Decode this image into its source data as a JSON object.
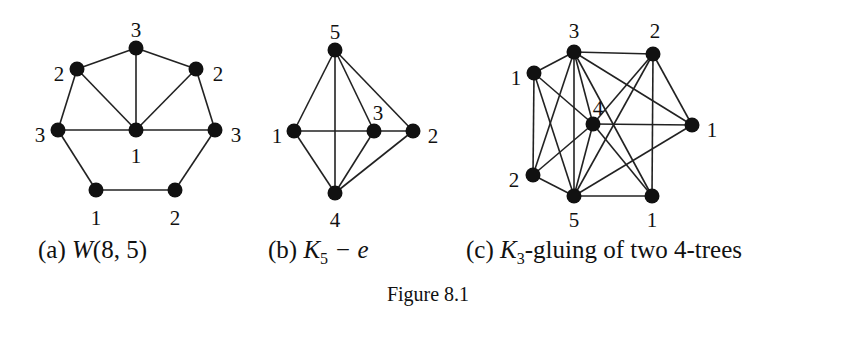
{
  "figure": {
    "caption": "Figure 8.1",
    "subfigures": [
      {
        "id": "a",
        "label": "(a)",
        "name_main": "W",
        "name_rest": "(8, 5)",
        "nodes": [
          {
            "id": "top",
            "x": 136,
            "y": 48,
            "label": "3",
            "lx": 136,
            "ly": 32
          },
          {
            "id": "ul",
            "x": 77,
            "y": 69,
            "label": "2",
            "lx": 59,
            "ly": 76
          },
          {
            "id": "ur",
            "x": 196,
            "y": 69,
            "label": "2",
            "lx": 218,
            "ly": 76
          },
          {
            "id": "l",
            "x": 58,
            "y": 130,
            "label": "3",
            "lx": 40,
            "ly": 137
          },
          {
            "id": "c",
            "x": 136,
            "y": 130,
            "label": "1",
            "lx": 136,
            "ly": 158
          },
          {
            "id": "r",
            "x": 215,
            "y": 130,
            "label": "3",
            "lx": 236,
            "ly": 137
          },
          {
            "id": "bl",
            "x": 96,
            "y": 190,
            "label": "1",
            "lx": 96,
            "ly": 220
          },
          {
            "id": "br",
            "x": 175,
            "y": 190,
            "label": "2",
            "lx": 175,
            "ly": 220
          }
        ],
        "edges": [
          [
            "top",
            "ul"
          ],
          [
            "top",
            "ur"
          ],
          [
            "ul",
            "l"
          ],
          [
            "ur",
            "r"
          ],
          [
            "l",
            "bl"
          ],
          [
            "r",
            "br"
          ],
          [
            "bl",
            "br"
          ],
          [
            "c",
            "top"
          ],
          [
            "c",
            "ul"
          ],
          [
            "c",
            "ur"
          ],
          [
            "c",
            "l"
          ],
          [
            "c",
            "r"
          ]
        ]
      },
      {
        "id": "b",
        "label": "(b)",
        "name_main": "K",
        "name_sub": "5",
        "name_rest": " − e",
        "nodes": [
          {
            "id": "n5",
            "x": 335,
            "y": 50,
            "label": "5",
            "lx": 335,
            "ly": 34
          },
          {
            "id": "n1",
            "x": 294,
            "y": 131,
            "label": "1",
            "lx": 277,
            "ly": 138
          },
          {
            "id": "n3",
            "x": 374,
            "y": 131,
            "label": "3",
            "lx": 378,
            "ly": 115
          },
          {
            "id": "n2",
            "x": 413,
            "y": 131,
            "label": "2",
            "lx": 433,
            "ly": 138
          },
          {
            "id": "n4",
            "x": 335,
            "y": 193,
            "label": "4",
            "lx": 335,
            "ly": 222
          }
        ],
        "edges": [
          [
            "n5",
            "n1"
          ],
          [
            "n5",
            "n4"
          ],
          [
            "n5",
            "n3"
          ],
          [
            "n5",
            "n2"
          ],
          [
            "n1",
            "n3"
          ],
          [
            "n3",
            "n2"
          ],
          [
            "n1",
            "n4"
          ],
          [
            "n3",
            "n4"
          ],
          [
            "n2",
            "n4"
          ]
        ]
      },
      {
        "id": "c",
        "label": "(c)",
        "name_main": "K",
        "name_sub": "3",
        "name_rest": "-gluing of two 4-trees",
        "nodes": [
          {
            "id": "a3",
            "x": 574,
            "y": 52,
            "label": "3",
            "lx": 574,
            "ly": 33
          },
          {
            "id": "b2",
            "x": 653,
            "y": 54,
            "label": "2",
            "lx": 655,
            "ly": 33
          },
          {
            "id": "c1",
            "x": 534,
            "y": 73,
            "label": "1",
            "lx": 516,
            "ly": 80
          },
          {
            "id": "d4",
            "x": 593,
            "y": 124,
            "label": "4",
            "lx": 598,
            "ly": 110
          },
          {
            "id": "e1",
            "x": 692,
            "y": 125,
            "label": "1",
            "lx": 712,
            "ly": 132
          },
          {
            "id": "f2",
            "x": 533,
            "y": 175,
            "label": "2",
            "lx": 514,
            "ly": 182
          },
          {
            "id": "g5",
            "x": 574,
            "y": 196,
            "label": "5",
            "lx": 574,
            "ly": 222
          },
          {
            "id": "h1",
            "x": 652,
            "y": 196,
            "label": "1",
            "lx": 652,
            "ly": 222
          }
        ],
        "edges": [
          [
            "c1",
            "a3"
          ],
          [
            "c1",
            "d4"
          ],
          [
            "c1",
            "f2"
          ],
          [
            "c1",
            "g5"
          ],
          [
            "a3",
            "b2"
          ],
          [
            "a3",
            "f2"
          ],
          [
            "a3",
            "g5"
          ],
          [
            "a3",
            "d4"
          ],
          [
            "a3",
            "e1"
          ],
          [
            "a3",
            "h1"
          ],
          [
            "f2",
            "d4"
          ],
          [
            "f2",
            "g5"
          ],
          [
            "d4",
            "e1"
          ],
          [
            "d4",
            "g5"
          ],
          [
            "d4",
            "h1"
          ],
          [
            "b2",
            "d4"
          ],
          [
            "b2",
            "g5"
          ],
          [
            "b2",
            "h1"
          ],
          [
            "b2",
            "e1"
          ],
          [
            "g5",
            "h1"
          ],
          [
            "g5",
            "e1"
          ]
        ]
      }
    ]
  }
}
